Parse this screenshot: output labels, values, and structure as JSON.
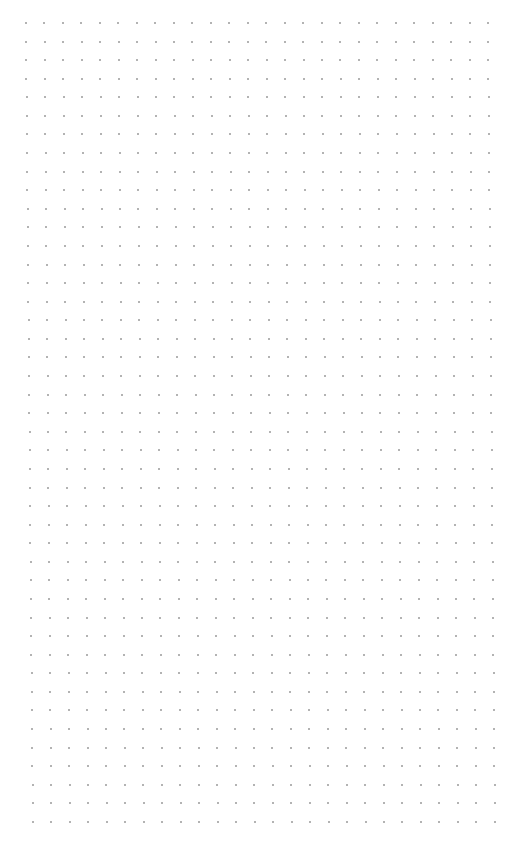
{
  "canvas": {
    "type": "dot-grid",
    "background": "#ffffff",
    "dot_color": "#9a9a9a",
    "columns": 26,
    "rows": 44,
    "origin_x": 26,
    "origin_y": 23,
    "spacing_x": 18.48,
    "spacing_y": 18.58,
    "skew_x_per_row": 0.16
  }
}
